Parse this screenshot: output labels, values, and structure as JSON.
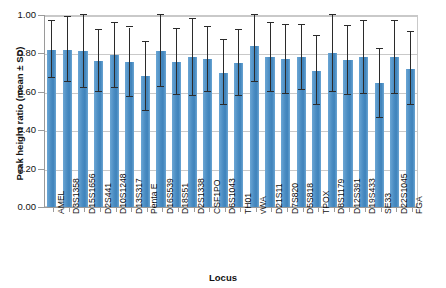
{
  "chart_data": {
    "type": "bar",
    "title": "",
    "xlabel": "Locus",
    "ylabel": "Peak height ratio (mean ± SD)",
    "ylim": [
      0.0,
      1.0
    ],
    "ytick_labels": [
      "1.00",
      "0.80",
      "0.60",
      "0.40",
      "0.20",
      "0.00"
    ],
    "ytick_values": [
      1.0,
      0.8,
      0.6,
      0.4,
      0.2,
      0.0
    ],
    "grid": true,
    "legend": "none",
    "bar_color": "#4f8fc4",
    "error_color": "#2b2b2b",
    "categories": [
      "AMEL",
      "D3S1358",
      "D15S1656",
      "D2S441",
      "D10S1248",
      "D13S317",
      "Penta E",
      "D16S539",
      "D18S51",
      "D2S1338",
      "CSF1PO",
      "D6S1043",
      "TH01",
      "vWA",
      "D21S11",
      "D7S820",
      "D5S818",
      "TPOX",
      "D8S1179",
      "D12S391",
      "D19S433",
      "SE33",
      "D22S1045",
      "FGA"
    ],
    "values": [
      0.82,
      0.82,
      0.81,
      0.76,
      0.79,
      0.755,
      0.68,
      0.815,
      0.755,
      0.78,
      0.77,
      0.7,
      0.75,
      0.84,
      0.78,
      0.77,
      0.78,
      0.71,
      0.8,
      0.765,
      0.78,
      0.645,
      0.78,
      0.72
    ],
    "errors": [
      0.15,
      0.17,
      0.19,
      0.16,
      0.17,
      0.18,
      0.18,
      0.19,
      0.17,
      0.2,
      0.17,
      0.17,
      0.17,
      0.19,
      0.18,
      0.18,
      0.17,
      0.18,
      0.2,
      0.18,
      0.19,
      0.18,
      0.19,
      0.19
    ]
  }
}
